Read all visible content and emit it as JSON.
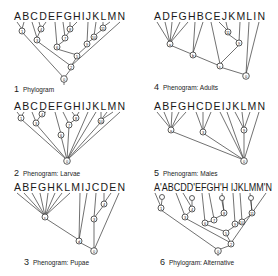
{
  "panels": [
    {
      "id": 1,
      "number": "1",
      "title": "Phylogram",
      "taxa": "ABCDEFGHIJKLMN",
      "nodes": [
        "1",
        "3",
        "4",
        "6",
        "7",
        "8",
        "5",
        "9",
        "10",
        "11",
        "2",
        "0"
      ]
    },
    {
      "id": 2,
      "number": "2",
      "title": "Phenogram: Larvae",
      "taxa": "ABCDEFGHIJKLMN",
      "nodes": [
        "1",
        "3",
        "4",
        "6",
        "7",
        "8",
        "10",
        "0"
      ]
    },
    {
      "id": 3,
      "number": "3",
      "title": "Phenogram: Pupae",
      "taxa": "ABFGHKLMIJCDEN",
      "nodes": [
        "c",
        "d",
        "3",
        "4",
        "0"
      ]
    },
    {
      "id": 4,
      "number": "4",
      "title": "Phenogram: Adults",
      "taxa": "ADFGHBCEJKMLIN",
      "nodes": [
        "a",
        "b",
        "c",
        "11",
        "9",
        "0"
      ]
    },
    {
      "id": 5,
      "number": "5",
      "title": "Phenogram: Males",
      "taxa": "ABFGHCDEIJKLMN",
      "nodes": [
        "a",
        "3",
        "9",
        "0"
      ]
    },
    {
      "id": 6,
      "number": "6",
      "title": "Phylogram: Alternative",
      "taxa": "A'ABCDD'EFGH'H IJKLMM'N",
      "nodes": [
        "1",
        "3",
        "4",
        "6",
        "7",
        "8",
        "5",
        "9",
        "10",
        "11",
        "2",
        "0"
      ]
    }
  ]
}
